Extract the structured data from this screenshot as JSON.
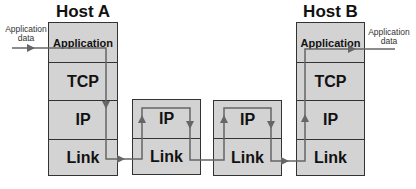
{
  "hosts": {
    "a": {
      "title": "Host A",
      "layers": [
        "Application",
        "TCP",
        "IP",
        "Link"
      ]
    },
    "b": {
      "title": "Host B",
      "layers": [
        "Application",
        "TCP",
        "IP",
        "Link"
      ]
    }
  },
  "routers": [
    {
      "layers": [
        "IP",
        "Link"
      ]
    },
    {
      "layers": [
        "IP",
        "Link"
      ]
    }
  ],
  "labels": {
    "input": "Application data",
    "input_line1": "Application",
    "input_line2": "data",
    "output_line1": "Application",
    "output_line2": "data"
  },
  "colors": {
    "box_fill": "#d3d3d3",
    "border": "#333333",
    "flow_line": "#666666"
  }
}
